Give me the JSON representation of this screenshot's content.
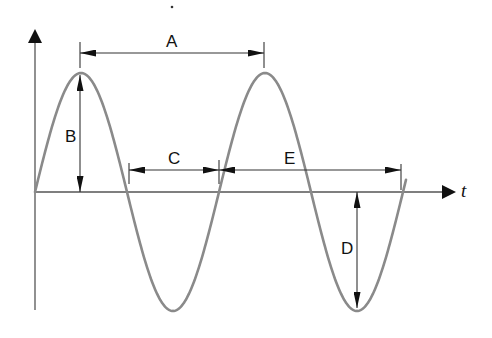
{
  "diagram": {
    "title": "",
    "axis_label_t": "t",
    "labels": {
      "A": "A",
      "B": "B",
      "C": "C",
      "D": "D",
      "E": "E"
    },
    "descriptions": {
      "A": "Distance between two successive peaks (wavelength / period)",
      "B": "Peak amplitude above axis",
      "C": "Half cycle between two zero crossings",
      "D": "Trough amplitude below axis",
      "E": "Distance from zero crossing to end of cycle"
    },
    "colors": {
      "wave": "#8a8a8a",
      "axes": "#555555",
      "arrows": "#111111",
      "background": "#ffffff"
    },
    "geometry": {
      "origin": [
        35,
        192
      ],
      "amplitude_px": 119,
      "period_px": 184,
      "peak1": [
        80,
        73
      ],
      "peak2": [
        264,
        73
      ],
      "trough1": [
        172,
        310
      ],
      "trough2": [
        357,
        311
      ]
    }
  }
}
